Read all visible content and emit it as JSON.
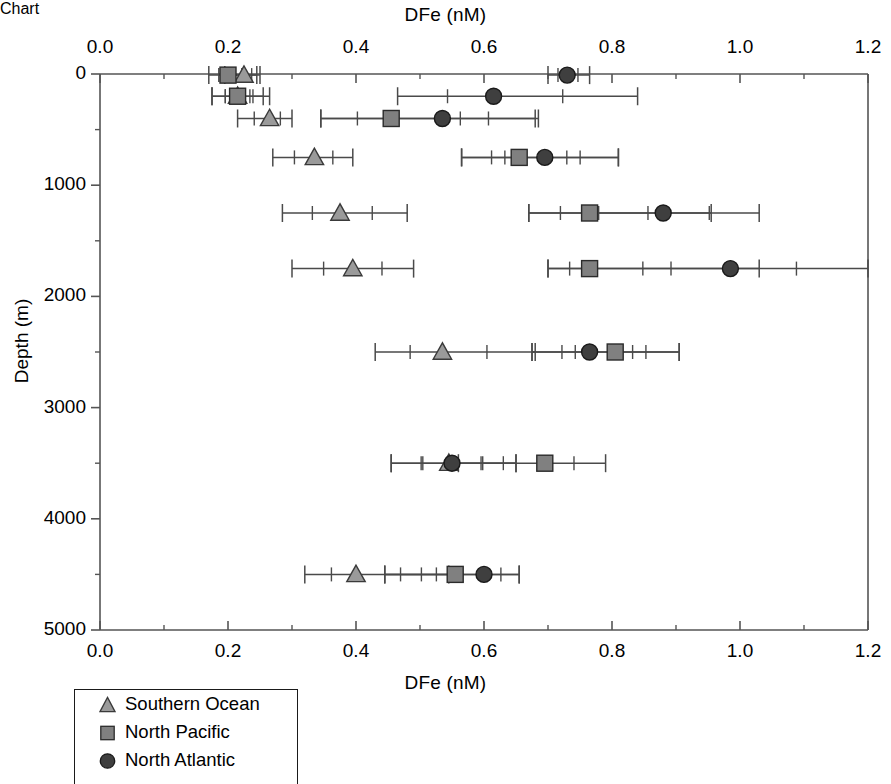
{
  "chart_data": {
    "type": "scatter",
    "title": "DFe (nM)",
    "title_bottom": "DFe (nM)",
    "xlabel": "DFe (nM)",
    "ylabel": "Depth (m)",
    "xlim": [
      0.0,
      1.2
    ],
    "ylim": [
      0,
      5000
    ],
    "y_inverted": true,
    "grid": false,
    "legend_position": "bottom-left",
    "x_ticks": [
      "0.0",
      "0.2",
      "0.4",
      "0.6",
      "0.8",
      "1.0",
      "1.2"
    ],
    "x_tick_values": [
      0.0,
      0.2,
      0.4,
      0.6,
      0.8,
      1.0,
      1.2
    ],
    "x_minor_ticks": [
      0.1,
      0.3,
      0.5,
      0.7,
      0.9,
      1.1
    ],
    "y_ticks": [
      "0",
      "1000",
      "2000",
      "3000",
      "4000",
      "5000"
    ],
    "y_tick_values": [
      0,
      1000,
      2000,
      3000,
      4000,
      5000
    ],
    "y_minor_ticks": [
      500,
      1500,
      2500,
      3500,
      4500
    ],
    "error_bar_style": "horizontal whiskers with caps; inner ticks mark standard deviation",
    "series": [
      {
        "name": "Southern Ocean",
        "marker": "triangle",
        "color": "#9a9a9a",
        "edge_color": "#3a3a3a",
        "points": [
          {
            "depth": 10,
            "value": 0.225,
            "err_low": 0.195,
            "err_high": 0.25
          },
          {
            "depth": 200,
            "value": 0.215,
            "err_low": 0.175,
            "err_high": 0.255
          },
          {
            "depth": 400,
            "value": 0.265,
            "err_low": 0.215,
            "err_high": 0.3
          },
          {
            "depth": 750,
            "value": 0.335,
            "err_low": 0.27,
            "err_high": 0.395
          },
          {
            "depth": 1250,
            "value": 0.375,
            "err_low": 0.285,
            "err_high": 0.48
          },
          {
            "depth": 1750,
            "value": 0.395,
            "err_low": 0.3,
            "err_high": 0.49
          },
          {
            "depth": 2500,
            "value": 0.535,
            "err_low": 0.43,
            "err_high": 0.68
          },
          {
            "depth": 3500,
            "value": 0.545,
            "err_low": 0.455,
            "err_high": 0.65
          },
          {
            "depth": 4500,
            "value": 0.4,
            "err_low": 0.32,
            "err_high": 0.545
          }
        ]
      },
      {
        "name": "North Pacific",
        "marker": "square",
        "color": "#808080",
        "edge_color": "#2b2b2b",
        "points": [
          {
            "depth": 10,
            "value": 0.2,
            "err_low": 0.17,
            "err_high": 0.245
          },
          {
            "depth": 200,
            "value": 0.215,
            "err_low": 0.175,
            "err_high": 0.265
          },
          {
            "depth": 400,
            "value": 0.455,
            "err_low": 0.345,
            "err_high": 0.68
          },
          {
            "depth": 750,
            "value": 0.655,
            "err_low": 0.565,
            "err_high": 0.81
          },
          {
            "depth": 1250,
            "value": 0.765,
            "err_low": 0.67,
            "err_high": 0.955
          },
          {
            "depth": 1750,
            "value": 0.765,
            "err_low": 0.7,
            "err_high": 1.03
          },
          {
            "depth": 2500,
            "value": 0.805,
            "err_low": 0.675,
            "err_high": 0.905
          },
          {
            "depth": 3500,
            "value": 0.695,
            "err_low": 0.56,
            "err_high": 0.79
          },
          {
            "depth": 4500,
            "value": 0.555,
            "err_low": 0.445,
            "err_high": 0.655
          }
        ]
      },
      {
        "name": "North Atlantic",
        "marker": "circle",
        "color": "#3f3f3f",
        "edge_color": "#1a1a1a",
        "points": [
          {
            "depth": 10,
            "value": 0.73,
            "err_low": 0.7,
            "err_high": 0.765
          },
          {
            "depth": 200,
            "value": 0.615,
            "err_low": 0.465,
            "err_high": 0.84
          },
          {
            "depth": 400,
            "value": 0.535,
            "err_low": 0.345,
            "err_high": 0.685
          },
          {
            "depth": 750,
            "value": 0.695,
            "err_low": 0.565,
            "err_high": 0.81
          },
          {
            "depth": 1250,
            "value": 0.88,
            "err_low": 0.67,
            "err_high": 1.03
          },
          {
            "depth": 1750,
            "value": 0.985,
            "err_low": 0.7,
            "err_high": 1.2
          },
          {
            "depth": 2500,
            "value": 0.765,
            "err_low": 0.675,
            "err_high": 0.905
          },
          {
            "depth": 3500,
            "value": 0.55,
            "err_low": 0.455,
            "err_high": 0.65
          },
          {
            "depth": 4500,
            "value": 0.6,
            "err_low": 0.445,
            "err_high": 0.655
          }
        ]
      }
    ]
  },
  "legend": {
    "items": [
      {
        "label": "Southern Ocean",
        "marker": "triangle-icon"
      },
      {
        "label": "North Pacific",
        "marker": "square-icon"
      },
      {
        "label": "North Atlantic",
        "marker": "circle-icon"
      }
    ]
  }
}
